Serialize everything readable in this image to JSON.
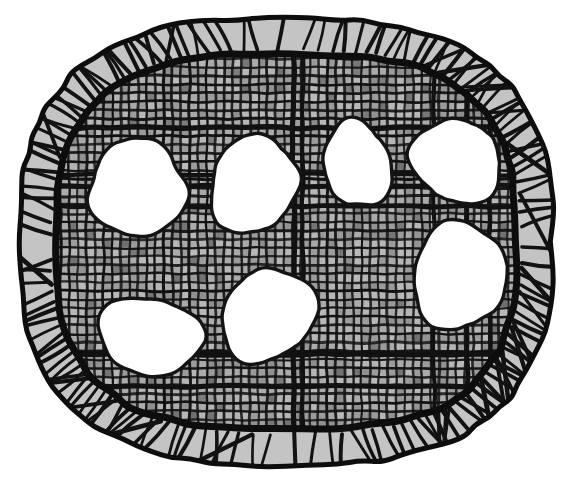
{
  "figure": {
    "title": "Hand-drawn cross-hatched oval with seven white blobs",
    "caption": "",
    "medium": "pen-and-ink hatching",
    "background_color": "#ffffff",
    "ink_color": "#000000"
  },
  "palette": {
    "paper": "#ffffff",
    "ink": "#121212",
    "ink_soft": "#2a2a2a",
    "mesh_cell_light": "#b9b9b9",
    "mesh_cell_mid": "#9a9a9a",
    "mesh_cell_dark": "#7a7a7a",
    "rim_fill": "#c4c4c4",
    "blob_fill": "#ffffff"
  },
  "canvas": {
    "width": 573,
    "height": 484
  },
  "outline": {
    "name": "outer-contour",
    "shape": "rounded-oval",
    "bounds": {
      "x": 17,
      "y": 15,
      "width": 538,
      "height": 453
    },
    "stroke_width": 5
  },
  "rim": {
    "name": "hatched-rim-band",
    "band_width": 32,
    "hatch_stroke_count": 150,
    "hatch_angle_mode": "radial-with-jitter",
    "hatch_stroke_width": 3.4
  },
  "inner_contour": {
    "name": "inner-contour",
    "bounds": {
      "x": 52,
      "y": 50,
      "width": 468,
      "height": 383
    },
    "stroke_width": 7
  },
  "mesh": {
    "name": "woven-grid-mesh",
    "cell_size": 8.6,
    "line_width": 2.6,
    "wobble": 1.1,
    "columns": 56,
    "rows": 46
  },
  "blobs": [
    {
      "id": "blob-1",
      "label": "upper-left blob",
      "cx": 137,
      "cy": 186,
      "rx": 53,
      "ry": 48,
      "rotation": -6,
      "seed": 11
    },
    {
      "id": "blob-2",
      "label": "upper-center-left blob",
      "cx": 254,
      "cy": 182,
      "rx": 47,
      "ry": 49,
      "rotation": 4,
      "seed": 23
    },
    {
      "id": "blob-3",
      "label": "upper-center-right blob",
      "cx": 357,
      "cy": 162,
      "rx": 36,
      "ry": 44,
      "rotation": -3,
      "seed": 37
    },
    {
      "id": "blob-4",
      "label": "upper-right blob",
      "cx": 457,
      "cy": 159,
      "rx": 44,
      "ry": 46,
      "rotation": 5,
      "seed": 51
    },
    {
      "id": "blob-5",
      "label": "middle-right blob",
      "cx": 459,
      "cy": 273,
      "rx": 51,
      "ry": 53,
      "rotation": -8,
      "seed": 67
    },
    {
      "id": "blob-6",
      "label": "lower-left blob",
      "cx": 150,
      "cy": 334,
      "rx": 50,
      "ry": 44,
      "rotation": 7,
      "seed": 83
    },
    {
      "id": "blob-7",
      "label": "lower-center blob",
      "cx": 268,
      "cy": 313,
      "rx": 47,
      "ry": 50,
      "rotation": -4,
      "seed": 97
    }
  ],
  "counts": {
    "blob_count": 7,
    "blob_count_label": "7"
  }
}
